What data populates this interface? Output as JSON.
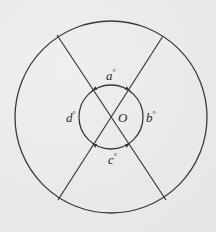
{
  "diagram": {
    "colors": {
      "background": "#ebebea",
      "stroke": "#3a3a3a",
      "text": "#2b2b2b"
    },
    "outer_circle": {
      "cx": 111,
      "cy": 117,
      "r": 96
    },
    "inner_circle": {
      "cx": 111,
      "cy": 117,
      "r": 32
    },
    "center": {
      "label": "O",
      "x": 111,
      "y": 117
    },
    "lines": [
      {
        "name": "line-upper-left-to-lower-right",
        "x1": 57,
        "y1": 35,
        "x2": 166,
        "y2": 200
      },
      {
        "name": "line-upper-right-to-lower-left",
        "x1": 163,
        "y1": 36,
        "x2": 58,
        "y2": 200
      }
    ],
    "angle_labels": [
      {
        "name": "a",
        "text": "a",
        "unit": "°",
        "position": "top"
      },
      {
        "name": "b",
        "text": "b",
        "unit": "°",
        "position": "right"
      },
      {
        "name": "c",
        "text": "c",
        "unit": "°",
        "position": "bottom"
      },
      {
        "name": "d",
        "text": "d",
        "unit": "°",
        "position": "left"
      }
    ]
  }
}
